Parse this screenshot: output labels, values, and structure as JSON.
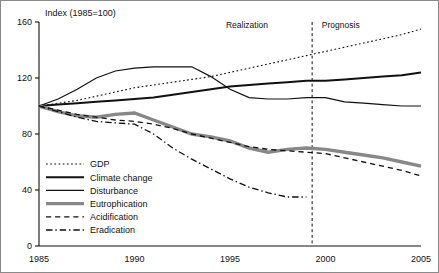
{
  "chart_data": {
    "type": "line",
    "title": "",
    "ylabel": "Index (1985=100)",
    "xlabel": "",
    "xlim": [
      1985,
      2005
    ],
    "ylim": [
      0,
      160
    ],
    "xticks": [
      1985,
      1990,
      1995,
      2000,
      2005
    ],
    "yticks": [
      0,
      40,
      80,
      120,
      160
    ],
    "grid": false,
    "legend_position": "inside-left-lower",
    "annotations": [
      {
        "text": "Realization",
        "x": 1997.2,
        "y": 156
      },
      {
        "text": "Prognosis",
        "x": 1999.6,
        "y": 156
      }
    ],
    "divider_x": 1999.3,
    "series": [
      {
        "name": "GDP",
        "style": "dotted",
        "color": "#111111",
        "width": 1.1,
        "x": [
          1985,
          1986,
          1987,
          1988,
          1989,
          1990,
          1991,
          1992,
          1993,
          1994,
          1995,
          1996,
          1997,
          1998,
          1999,
          2000,
          2001,
          2002,
          2003,
          2004,
          2005
        ],
        "values": [
          100,
          102,
          104,
          107,
          110,
          113,
          115,
          117,
          119,
          121,
          124,
          127,
          130,
          133,
          136,
          139,
          142,
          145,
          148,
          151,
          155
        ]
      },
      {
        "name": "Climate change",
        "style": "solid",
        "color": "#111111",
        "width": 2.0,
        "x": [
          1985,
          1986,
          1987,
          1988,
          1989,
          1990,
          1991,
          1992,
          1993,
          1994,
          1995,
          1996,
          1997,
          1998,
          1999,
          2000,
          2001,
          2002,
          2003,
          2004,
          2005
        ],
        "values": [
          100,
          101,
          102,
          103,
          104,
          105,
          106,
          108,
          110,
          112,
          114,
          115,
          116,
          117,
          118,
          118,
          119,
          120,
          121,
          122,
          124
        ]
      },
      {
        "name": "Disturbance",
        "style": "solid",
        "color": "#111111",
        "width": 1.2,
        "x": [
          1985,
          1986,
          1987,
          1988,
          1989,
          1990,
          1991,
          1992,
          1993,
          1994,
          1995,
          1996,
          1997,
          1998,
          1999,
          2000,
          2001,
          2002,
          2003,
          2004,
          2005
        ],
        "values": [
          100,
          105,
          112,
          120,
          125,
          127,
          128,
          128,
          128,
          121,
          112,
          106,
          105,
          105,
          106,
          106,
          103,
          102,
          101,
          100,
          100
        ]
      },
      {
        "name": "Eutrophication",
        "style": "solid",
        "color": "#888888",
        "width": 3.4,
        "x": [
          1985,
          1986,
          1987,
          1988,
          1989,
          1990,
          1991,
          1992,
          1993,
          1994,
          1995,
          1996,
          1997,
          1998,
          1999,
          2000,
          2001,
          2002,
          2003,
          2004,
          2005
        ],
        "values": [
          100,
          96,
          93,
          92,
          94,
          95,
          90,
          85,
          80,
          78,
          75,
          70,
          67,
          69,
          70,
          69,
          67,
          65,
          63,
          60,
          57
        ]
      },
      {
        "name": "Acidification",
        "style": "dashed",
        "color": "#111111",
        "width": 1.3,
        "x": [
          1985,
          1986,
          1987,
          1988,
          1989,
          1990,
          1991,
          1992,
          1993,
          1994,
          1995,
          1996,
          1997,
          1998,
          1999,
          2000,
          2001,
          2002,
          2003,
          2004,
          2005
        ],
        "values": [
          100,
          97,
          94,
          92,
          90,
          89,
          87,
          84,
          80,
          77,
          74,
          71,
          69,
          68,
          67,
          66,
          63,
          60,
          57,
          54,
          50
        ]
      },
      {
        "name": "Eradication",
        "style": "dashdot",
        "color": "#111111",
        "width": 1.3,
        "x": [
          1985,
          1986,
          1987,
          1988,
          1989,
          1990,
          1991,
          1992,
          1993,
          1994,
          1995,
          1996,
          1997,
          1998,
          1999
        ],
        "values": [
          100,
          96,
          92,
          89,
          88,
          87,
          80,
          70,
          62,
          55,
          48,
          42,
          38,
          35,
          35
        ]
      }
    ]
  },
  "legend": {
    "items": [
      {
        "label": "GDP",
        "style": "dotted",
        "color": "#111111",
        "width": 1.1
      },
      {
        "label": "Climate change",
        "style": "solid",
        "color": "#111111",
        "width": 2.0
      },
      {
        "label": "Disturbance",
        "style": "solid",
        "color": "#111111",
        "width": 1.2
      },
      {
        "label": "Eutrophication",
        "style": "solid",
        "color": "#888888",
        "width": 3.4
      },
      {
        "label": "Acidification",
        "style": "dashed",
        "color": "#111111",
        "width": 1.3
      },
      {
        "label": "Eradication",
        "style": "dashdot",
        "color": "#111111",
        "width": 1.3
      }
    ]
  }
}
